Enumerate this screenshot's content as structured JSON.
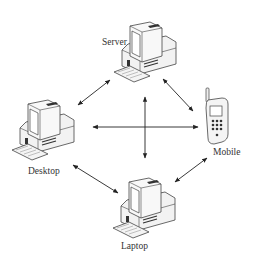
{
  "diagram": {
    "type": "network-topology",
    "nodes": [
      {
        "id": "server",
        "label": "Server",
        "icon": "desktop-computer-icon"
      },
      {
        "id": "desktop",
        "label": "Desktop",
        "icon": "desktop-computer-icon"
      },
      {
        "id": "mobile",
        "label": "Mobile",
        "icon": "mobile-phone-icon"
      },
      {
        "id": "laptop",
        "label": "Laptop",
        "icon": "desktop-computer-icon"
      }
    ],
    "edges": [
      {
        "from": "server",
        "to": "desktop",
        "direction": "bidirectional"
      },
      {
        "from": "server",
        "to": "mobile",
        "direction": "bidirectional"
      },
      {
        "from": "desktop",
        "to": "mobile",
        "direction": "bidirectional"
      },
      {
        "from": "server",
        "to": "laptop",
        "direction": "bidirectional"
      },
      {
        "from": "desktop",
        "to": "laptop",
        "direction": "bidirectional"
      },
      {
        "from": "mobile",
        "to": "laptop",
        "direction": "bidirectional"
      }
    ],
    "colors": {
      "line": "#222222",
      "device_fill": "#f4f4f4",
      "device_stroke": "#444444",
      "screen": "#ffffff",
      "dark": "#333333"
    }
  }
}
